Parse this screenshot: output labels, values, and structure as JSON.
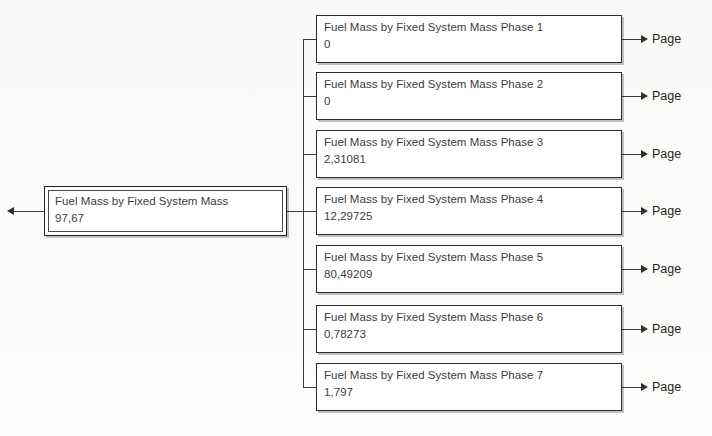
{
  "diagram": {
    "type": "tree",
    "orientation": "left-to-right",
    "root": {
      "title": "Fuel Mass by Fixed System Mass",
      "value": "97,67",
      "incoming_arrow": "arrow-left"
    },
    "children": [
      {
        "title": "Fuel Mass by Fixed System Mass Phase 1",
        "value": "0",
        "leaf_label": "Page"
      },
      {
        "title": "Fuel Mass by Fixed System Mass Phase 2",
        "value": "0",
        "leaf_label": "Page"
      },
      {
        "title": "Fuel Mass by Fixed System Mass Phase 3",
        "value": "2,31081",
        "leaf_label": "Page"
      },
      {
        "title": "Fuel Mass by Fixed System Mass Phase 4",
        "value": "12,29725",
        "leaf_label": "Page"
      },
      {
        "title": "Fuel Mass by Fixed System Mass Phase 5",
        "value": "80,49209",
        "leaf_label": "Page"
      },
      {
        "title": "Fuel Mass by Fixed System Mass Phase 6",
        "value": "0,78273",
        "leaf_label": "Page"
      },
      {
        "title": "Fuel Mass by Fixed System Mass Phase 7",
        "value": "1,797",
        "leaf_label": "Page"
      }
    ],
    "colors": {
      "paper": "#fdfdfc",
      "box_fill": "#ffffff",
      "box_border": "#2b2b2b",
      "text": "#3c3c3c",
      "connector": "#3a3a3a",
      "shadow": "#8c8c8c"
    }
  }
}
